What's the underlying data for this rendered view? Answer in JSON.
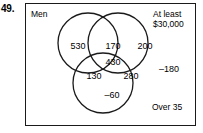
{
  "problem": {
    "number": "49."
  },
  "diagram": {
    "type": "venn-3-set",
    "sets": [
      {
        "id": "men",
        "label": "Men"
      },
      {
        "id": "income",
        "label": "At least\n$30,000"
      },
      {
        "id": "age",
        "label": "Over 35"
      }
    ],
    "regions": [
      {
        "id": "men-only",
        "value": "530"
      },
      {
        "id": "men-income",
        "value": "170"
      },
      {
        "id": "income-only",
        "value": "200"
      },
      {
        "id": "men-income-age",
        "value": "430"
      },
      {
        "id": "men-age",
        "value": "130"
      },
      {
        "id": "income-age",
        "value": "280"
      },
      {
        "id": "age-only",
        "value": "–60"
      },
      {
        "id": "outside-all",
        "value": "–180"
      }
    ]
  },
  "colors": {
    "stroke": "#1a1a1a",
    "text": "#000000",
    "background": "#ffffff"
  }
}
